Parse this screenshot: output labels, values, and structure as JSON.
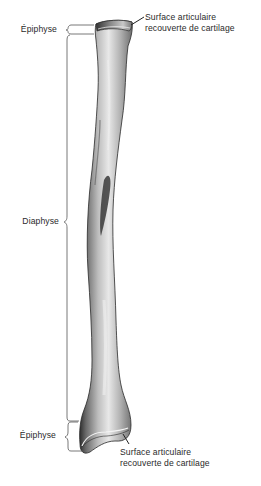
{
  "diagram": {
    "regions": [
      {
        "id": "epiphysis-top",
        "label": "Épiphyse"
      },
      {
        "id": "diaphysis",
        "label": "Diaphyse"
      },
      {
        "id": "epiphysis-bottom",
        "label": "Épiphyse"
      }
    ],
    "annotations": {
      "top": {
        "line1": "Surface articulaire",
        "line2": "recouverte de cartilage"
      },
      "bottom": {
        "line1": "Surface articulaire",
        "line2": "recouverte de cartilage"
      }
    },
    "colors": {
      "background": "#ffffff",
      "text": "#2a2a2a",
      "bracket": "#555555",
      "bone_light": "#e6e6e6",
      "bone_mid": "#a8a8a8",
      "bone_dark": "#2e2e2e"
    }
  }
}
